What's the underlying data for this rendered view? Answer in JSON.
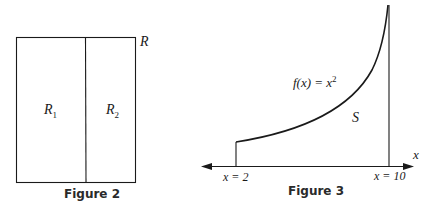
{
  "figure2": {
    "caption": "Figure 2",
    "region_label": "R",
    "subregions": [
      {
        "label": "R",
        "subscript": "1"
      },
      {
        "label": "R",
        "subscript": "2"
      }
    ]
  },
  "figure3": {
    "caption": "Figure 3",
    "function_label": "f(x) = x",
    "function_exponent": "2",
    "region_label": "S",
    "axis_label": "x",
    "left_bound_label": "x = 2",
    "right_bound_label": "x = 10",
    "left_bound": 2,
    "right_bound": 10
  }
}
